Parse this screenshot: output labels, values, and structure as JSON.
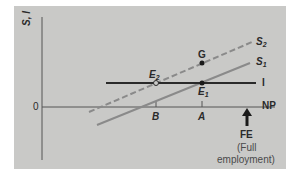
{
  "diagram": {
    "type": "saving-investment diagram",
    "y_axis_label": "S, I",
    "x_axis_label": "NP",
    "origin_label": "0",
    "lines": [
      {
        "name": "S2",
        "label_main": "S",
        "label_sub": "2",
        "style": "dashed",
        "color": "#8a8a8a"
      },
      {
        "name": "S1",
        "label_main": "S",
        "label_sub": "1",
        "style": "solid",
        "color": "#8a8a8a"
      },
      {
        "name": "I",
        "label_main": "I",
        "label_sub": "",
        "style": "solid",
        "color": "#2a2a2a"
      }
    ],
    "points": [
      {
        "name": "G",
        "label_main": "G",
        "label_sub": "",
        "style": "filled"
      },
      {
        "name": "E1",
        "label_main": "E",
        "label_sub": "1",
        "style": "filled"
      },
      {
        "name": "E2",
        "label_main": "E",
        "label_sub": "2",
        "style": "open"
      }
    ],
    "x_ticks": [
      {
        "label": "B"
      },
      {
        "label": "A"
      }
    ],
    "marker": {
      "label": "FE",
      "note_line1": "(Full",
      "note_line2": "employment)",
      "icon": "up-arrow-icon"
    },
    "colors": {
      "panel": "#c9c9c7",
      "axis": "#555555",
      "s_lines": "#8a8a8a",
      "i_line": "#2a2a2a",
      "text": "#2a2a2a"
    }
  }
}
